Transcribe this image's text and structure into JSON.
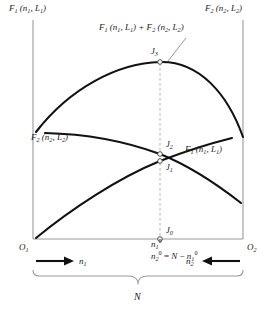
{
  "figure": {
    "type": "annotated-curve-diagram",
    "width": 277,
    "height": 313,
    "background_color": "#ffffff",
    "curve_color": "#111111",
    "frame_color": "#9a9a9a",
    "dashed_color": "#b0b0b0"
  },
  "labels": {
    "top_left": "F",
    "top_left_sub": "1",
    "top_left_args": " (n",
    "top_left_arg_sub": "1",
    "top_left_args2": ", L",
    "top_left_arg2_sub": "1",
    "top_left_close": ")",
    "top_right_plain": "F2 (n2, L2)",
    "top_center_plain": "F1 (n1, L1) + F2 (n2, L2)",
    "mid_left_plain": "F2 (n2, L2)",
    "mid_right_plain": "F1 (n1, L1)",
    "j3": "J",
    "j3_sub": "3",
    "j2": "J",
    "j2_sub": "2",
    "j1": "J",
    "j1_sub": "1",
    "j0": "J",
    "j0_sub": "0",
    "origin_left": "O",
    "origin_left_sub": "1",
    "origin_right": "O",
    "origin_right_sub": "2",
    "arrow_left_var": "n",
    "arrow_left_sub": "1",
    "arrow_right_var": "n",
    "arrow_right_sub": "2",
    "n1_zero_var": "n",
    "n1_zero_sub": "1",
    "n1_zero_sup": "0",
    "n2_eq_var": "n",
    "n2_eq_sub": "2",
    "n2_eq_sup": "0",
    "n2_eq_rel": " = N − n",
    "n2_eq_rel_sub": "1",
    "n2_eq_rel_sup": "0",
    "total": "N"
  },
  "chart_data": {
    "type": "line",
    "xlabel": "n1",
    "ylabel": "F",
    "xlim": [
      0,
      1
    ],
    "ylim": [
      0,
      1
    ],
    "grid": false,
    "legend_position": "inline-annotations",
    "axis_note": "Horizontal axis runs from O1 (left origin, n1 = 0) to O2 (right origin, n2 = 0); total length is N.",
    "vertical_reference_line": {
      "x": 0.55,
      "style": "dashed",
      "label": "n1 = n1^0 (optimum partition)",
      "marked_points": [
        "J0",
        "J1",
        "J2",
        "J3"
      ]
    },
    "series": [
      {
        "name": "F1 (n1, L1)",
        "label_position": "right-middle",
        "description": "Monotonically increasing concave curve rising from left to right",
        "x": [
          0.0,
          0.1,
          0.2,
          0.3,
          0.4,
          0.5,
          0.55,
          0.6,
          0.7,
          0.8,
          0.9,
          1.0
        ],
        "y": [
          0.0,
          0.11,
          0.21,
          0.3,
          0.38,
          0.44,
          0.47,
          0.49,
          0.54,
          0.58,
          0.61,
          0.63
        ]
      },
      {
        "name": "F2 (n2, L2)",
        "label_position": "left-middle",
        "description": "Gently decreasing concave curve falling from left to right, crosses F1 near n1^0",
        "x": [
          0.0,
          0.1,
          0.2,
          0.3,
          0.4,
          0.5,
          0.55,
          0.6,
          0.7,
          0.8,
          0.9,
          1.0
        ],
        "y": [
          0.64,
          0.635,
          0.625,
          0.61,
          0.585,
          0.55,
          0.525,
          0.5,
          0.44,
          0.36,
          0.26,
          0.13
        ]
      },
      {
        "name": "F1 (n1, L1) + F2 (n2, L2)",
        "label_position": "top-center",
        "description": "Sum curve, concave with maximum at n1 = n1^0",
        "x": [
          0.0,
          0.1,
          0.2,
          0.3,
          0.4,
          0.5,
          0.55,
          0.6,
          0.7,
          0.8,
          0.9,
          1.0
        ],
        "y": [
          0.64,
          0.745,
          0.835,
          0.91,
          0.965,
          0.99,
          0.995,
          0.99,
          0.98,
          0.94,
          0.87,
          0.76
        ]
      }
    ],
    "annotated_points": [
      {
        "name": "J3",
        "x": 0.55,
        "y": 0.995,
        "note": "maximum of the sum curve"
      },
      {
        "name": "J2",
        "x": 0.55,
        "y": 0.525,
        "note": "point on F2 curve at n1^0"
      },
      {
        "name": "J1",
        "x": 0.55,
        "y": 0.47,
        "note": "point on F1 curve at n1^0"
      },
      {
        "name": "J0",
        "x": 0.55,
        "y": 0.0,
        "note": "foot of the dashed line on the axis"
      }
    ]
  }
}
